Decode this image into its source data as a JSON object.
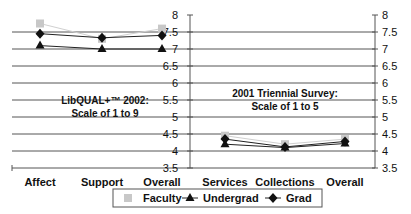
{
  "chart_data": {
    "type": "line",
    "title": "",
    "xlabel": "",
    "ylabel": "",
    "ylim": [
      3.5,
      8
    ],
    "yticks": [
      "8",
      "7.5",
      "7",
      "6.5",
      "6",
      "5.5",
      "5",
      "4.5",
      "4",
      "3.5"
    ],
    "ytick_values": [
      8,
      7.5,
      7,
      6.5,
      6,
      5.5,
      5,
      4.5,
      4,
      3.5
    ],
    "grid": true,
    "legend_position": "bottom",
    "panels": [
      {
        "annotation": [
          "LibQUAL+™ 2002:",
          "Scale of 1 to 9"
        ],
        "categories": [
          "Affect",
          "Support",
          "Overall"
        ],
        "series": [
          {
            "name": "Faculty",
            "marker": "square",
            "color": "#c8c8c8",
            "values": [
              7.75,
              7.3,
              7.6
            ]
          },
          {
            "name": "Undergrad",
            "marker": "triangle",
            "color": "#111111",
            "values": [
              7.1,
              7.0,
              7.0
            ]
          },
          {
            "name": "Grad",
            "marker": "diamond",
            "color": "#111111",
            "values": [
              7.45,
              7.33,
              7.4
            ]
          }
        ]
      },
      {
        "annotation": [
          "2001 Triennial Survey:",
          "Scale of 1 to 5"
        ],
        "categories": [
          "Services",
          "Collections",
          "Overall"
        ],
        "series": [
          {
            "name": "Faculty",
            "marker": "square",
            "color": "#c8c8c8",
            "values": [
              4.45,
              4.2,
              4.35
            ]
          },
          {
            "name": "Undergrad",
            "marker": "triangle",
            "color": "#111111",
            "values": [
              4.2,
              4.1,
              4.22
            ]
          },
          {
            "name": "Grad",
            "marker": "diamond",
            "color": "#111111",
            "values": [
              4.35,
              4.12,
              4.28
            ]
          }
        ]
      }
    ],
    "legend": [
      "Faculty",
      "Undergrad",
      "Grad"
    ]
  }
}
